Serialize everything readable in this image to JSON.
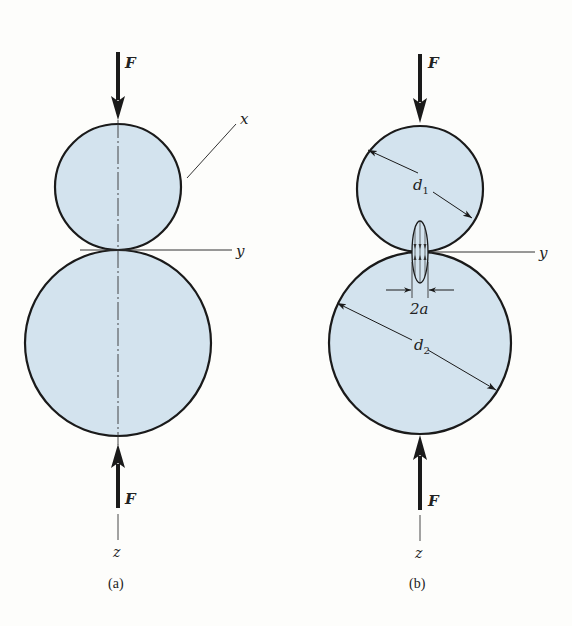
{
  "figure": {
    "colors": {
      "sphere_fill": "#d3e3ee",
      "stroke": "#1a1a1a",
      "background": "#fdfdfb"
    },
    "panel_a": {
      "caption": "(a)",
      "force_top_label": "F",
      "force_bottom_label": "F",
      "axis_x_label": "x",
      "axis_y_label": "y",
      "axis_z_label": "z"
    },
    "panel_b": {
      "caption": "(b)",
      "force_top_label": "F",
      "force_bottom_label": "F",
      "diameter_1_label": "d",
      "diameter_1_sub": "1",
      "diameter_2_label": "d",
      "diameter_2_sub": "2",
      "contact_width_label": "2a",
      "axis_y_label": "y",
      "axis_z_label": "z"
    }
  }
}
